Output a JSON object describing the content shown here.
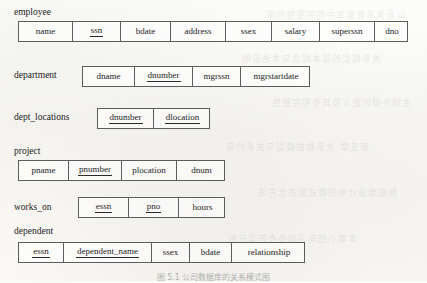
{
  "figure": {
    "caption": "图 5.1  公司数据库的关系模式图",
    "background_note": "scanned textbook page with reverse-side bleed-through"
  },
  "bleed_text": [
    "以及关系数据库中的完整性约束",
    "关系模型的基本概念与术语说明",
    "主键外键的定义及其参照完整性",
    "第五章  关系数据模型与关系约束",
    "数据库设计中的模式图表示方法",
    "本章小结与习题参考答案分析"
  ],
  "relations": [
    {
      "name": "employee",
      "label_x": 14,
      "label_y": 8,
      "table_x": 18,
      "table_y": 21,
      "table_width": 390,
      "attributes": [
        {
          "name": "name",
          "primary_key": false,
          "width": 54
        },
        {
          "name": "ssn",
          "primary_key": true,
          "width": 48
        },
        {
          "name": "bdate",
          "primary_key": false,
          "width": 50
        },
        {
          "name": "address",
          "primary_key": false,
          "width": 55
        },
        {
          "name": "ssex",
          "primary_key": false,
          "width": 46
        },
        {
          "name": "salary",
          "primary_key": false,
          "width": 48
        },
        {
          "name": "superssn",
          "primary_key": false,
          "width": 55
        },
        {
          "name": "dno",
          "primary_key": false,
          "width": 34
        }
      ]
    },
    {
      "name": "department",
      "label_x": 14,
      "label_y": 71,
      "table_x": 82,
      "table_y": 66,
      "table_width": 228,
      "attributes": [
        {
          "name": "dname",
          "primary_key": false,
          "width": 52
        },
        {
          "name": "dnumber",
          "primary_key": true,
          "width": 58
        },
        {
          "name": "mgrssn",
          "primary_key": false,
          "width": 48
        },
        {
          "name": "mgrstartdate",
          "primary_key": false,
          "width": 70
        }
      ]
    },
    {
      "name": "dept_locations",
      "label_x": 14,
      "label_y": 113,
      "table_x": 97,
      "table_y": 108,
      "table_width": 113,
      "attributes": [
        {
          "name": "dnumber",
          "primary_key": true,
          "width": 56
        },
        {
          "name": "dlocation",
          "primary_key": true,
          "width": 57
        }
      ]
    },
    {
      "name": "project",
      "label_x": 14,
      "label_y": 147,
      "table_x": 18,
      "table_y": 160,
      "table_width": 207,
      "attributes": [
        {
          "name": "pname",
          "primary_key": false,
          "width": 50
        },
        {
          "name": "pnumber",
          "primary_key": true,
          "width": 53
        },
        {
          "name": "plocation",
          "primary_key": false,
          "width": 55
        },
        {
          "name": "dnum",
          "primary_key": false,
          "width": 49
        }
      ]
    },
    {
      "name": "works_on",
      "label_x": 14,
      "label_y": 203,
      "table_x": 78,
      "table_y": 197,
      "table_width": 147,
      "attributes": [
        {
          "name": "essn",
          "primary_key": true,
          "width": 50
        },
        {
          "name": "pno",
          "primary_key": true,
          "width": 50
        },
        {
          "name": "hours",
          "primary_key": false,
          "width": 47
        }
      ]
    },
    {
      "name": "dependent",
      "label_x": 14,
      "label_y": 227,
      "table_x": 18,
      "table_y": 242,
      "table_width": 287,
      "attributes": [
        {
          "name": "essn",
          "primary_key": true,
          "width": 45
        },
        {
          "name": "dependent_name",
          "primary_key": true,
          "width": 88
        },
        {
          "name": "ssex",
          "primary_key": false,
          "width": 38
        },
        {
          "name": "bdate",
          "primary_key": false,
          "width": 42
        },
        {
          "name": "relationship",
          "primary_key": false,
          "width": 74
        }
      ]
    }
  ]
}
